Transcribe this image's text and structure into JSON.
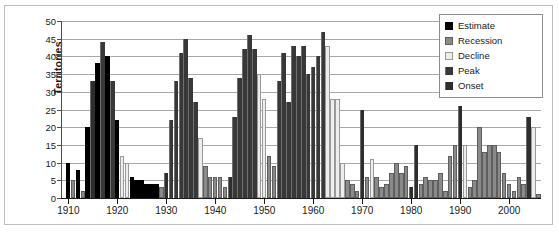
{
  "chart_data": {
    "type": "bar",
    "title": "",
    "xlabel": "",
    "ylabel": "Territories",
    "ylim": [
      0,
      50
    ],
    "ytick_step": 5,
    "yticks": [
      0,
      5,
      10,
      15,
      20,
      25,
      30,
      35,
      40,
      45,
      50
    ],
    "grid": true,
    "legend_position": "top-right",
    "xlim": [
      1909,
      2007
    ],
    "xtick_labels": [
      "1910",
      "1920",
      "1930",
      "1940",
      "1950",
      "1960",
      "1970",
      "1980",
      "1990",
      "2000"
    ],
    "xticks": [
      1910,
      1920,
      1930,
      1940,
      1950,
      1960,
      1970,
      1980,
      1990,
      2000
    ],
    "legend": [
      {
        "label": "Estimate",
        "color": "#000000"
      },
      {
        "label": "Recession",
        "color": "#8a8a8a"
      },
      {
        "label": "Decline",
        "color": "#ededed"
      },
      {
        "label": "Peak",
        "color": "#383838"
      },
      {
        "label": "Onset",
        "color": "#2e2e2e"
      }
    ],
    "series_names": [
      "Estimate",
      "Recession",
      "Decline",
      "Peak",
      "Onset"
    ],
    "points": [
      {
        "year": 1910,
        "value": 10,
        "category": "Estimate"
      },
      {
        "year": 1911,
        "value": 5,
        "category": "Recession"
      },
      {
        "year": 1912,
        "value": 8,
        "category": "Estimate"
      },
      {
        "year": 1913,
        "value": 2,
        "category": "Recession"
      },
      {
        "year": 1914,
        "value": 20,
        "category": "Estimate"
      },
      {
        "year": 1915,
        "value": 33,
        "category": "Onset"
      },
      {
        "year": 1916,
        "value": 38,
        "category": "Estimate"
      },
      {
        "year": 1917,
        "value": 44,
        "category": "Peak"
      },
      {
        "year": 1918,
        "value": 40,
        "category": "Estimate"
      },
      {
        "year": 1919,
        "value": 33,
        "category": "Peak"
      },
      {
        "year": 1920,
        "value": 22,
        "category": "Estimate"
      },
      {
        "year": 1921,
        "value": 12,
        "category": "Decline"
      },
      {
        "year": 1922,
        "value": 10,
        "category": "Decline"
      },
      {
        "year": 1923,
        "value": 6,
        "category": "Estimate"
      },
      {
        "year": 1924,
        "value": 5,
        "category": "Estimate"
      },
      {
        "year": 1925,
        "value": 5,
        "category": "Estimate"
      },
      {
        "year": 1926,
        "value": 4,
        "category": "Estimate"
      },
      {
        "year": 1927,
        "value": 4,
        "category": "Estimate"
      },
      {
        "year": 1928,
        "value": 4,
        "category": "Estimate"
      },
      {
        "year": 1929,
        "value": 3,
        "category": "Recession"
      },
      {
        "year": 1930,
        "value": 7,
        "category": "Onset"
      },
      {
        "year": 1931,
        "value": 22,
        "category": "Peak"
      },
      {
        "year": 1932,
        "value": 33,
        "category": "Peak"
      },
      {
        "year": 1933,
        "value": 41,
        "category": "Peak"
      },
      {
        "year": 1934,
        "value": 45,
        "category": "Peak"
      },
      {
        "year": 1935,
        "value": 34,
        "category": "Peak"
      },
      {
        "year": 1936,
        "value": 27,
        "category": "Peak"
      },
      {
        "year": 1937,
        "value": 17,
        "category": "Decline"
      },
      {
        "year": 1938,
        "value": 9,
        "category": "Recession"
      },
      {
        "year": 1939,
        "value": 6,
        "category": "Recession"
      },
      {
        "year": 1940,
        "value": 6,
        "category": "Recession"
      },
      {
        "year": 1941,
        "value": 6,
        "category": "Recession"
      },
      {
        "year": 1942,
        "value": 3,
        "category": "Recession"
      },
      {
        "year": 1943,
        "value": 6,
        "category": "Onset"
      },
      {
        "year": 1944,
        "value": 23,
        "category": "Peak"
      },
      {
        "year": 1945,
        "value": 34,
        "category": "Peak"
      },
      {
        "year": 1946,
        "value": 42,
        "category": "Peak"
      },
      {
        "year": 1947,
        "value": 46,
        "category": "Peak"
      },
      {
        "year": 1948,
        "value": 42,
        "category": "Peak"
      },
      {
        "year": 1949,
        "value": 35,
        "category": "Decline"
      },
      {
        "year": 1950,
        "value": 28,
        "category": "Decline"
      },
      {
        "year": 1951,
        "value": 12,
        "category": "Recession"
      },
      {
        "year": 1952,
        "value": 9,
        "category": "Recession"
      },
      {
        "year": 1953,
        "value": 33,
        "category": "Peak"
      },
      {
        "year": 1954,
        "value": 41,
        "category": "Peak"
      },
      {
        "year": 1955,
        "value": 27,
        "category": "Peak"
      },
      {
        "year": 1956,
        "value": 43,
        "category": "Peak"
      },
      {
        "year": 1957,
        "value": 40,
        "category": "Peak"
      },
      {
        "year": 1958,
        "value": 43,
        "category": "Peak"
      },
      {
        "year": 1959,
        "value": 35,
        "category": "Peak"
      },
      {
        "year": 1960,
        "value": 37,
        "category": "Peak"
      },
      {
        "year": 1961,
        "value": 40,
        "category": "Peak"
      },
      {
        "year": 1962,
        "value": 47,
        "category": "Peak"
      },
      {
        "year": 1963,
        "value": 43,
        "category": "Decline"
      },
      {
        "year": 1964,
        "value": 28,
        "category": "Decline"
      },
      {
        "year": 1965,
        "value": 28,
        "category": "Decline"
      },
      {
        "year": 1966,
        "value": 10,
        "category": "Decline"
      },
      {
        "year": 1967,
        "value": 5,
        "category": "Recession"
      },
      {
        "year": 1968,
        "value": 4,
        "category": "Recession"
      },
      {
        "year": 1969,
        "value": 2,
        "category": "Recession"
      },
      {
        "year": 1970,
        "value": 25,
        "category": "Onset"
      },
      {
        "year": 1971,
        "value": 6,
        "category": "Recession"
      },
      {
        "year": 1972,
        "value": 11,
        "category": "Decline"
      },
      {
        "year": 1973,
        "value": 6,
        "category": "Recession"
      },
      {
        "year": 1974,
        "value": 3,
        "category": "Recession"
      },
      {
        "year": 1975,
        "value": 4,
        "category": "Recession"
      },
      {
        "year": 1976,
        "value": 7,
        "category": "Recession"
      },
      {
        "year": 1977,
        "value": 10,
        "category": "Recession"
      },
      {
        "year": 1978,
        "value": 7,
        "category": "Recession"
      },
      {
        "year": 1979,
        "value": 9,
        "category": "Recession"
      },
      {
        "year": 1980,
        "value": 3,
        "category": "Onset"
      },
      {
        "year": 1981,
        "value": 15,
        "category": "Onset"
      },
      {
        "year": 1982,
        "value": 4,
        "category": "Recession"
      },
      {
        "year": 1983,
        "value": 6,
        "category": "Recession"
      },
      {
        "year": 1984,
        "value": 5,
        "category": "Recession"
      },
      {
        "year": 1985,
        "value": 5,
        "category": "Recession"
      },
      {
        "year": 1986,
        "value": 7,
        "category": "Recession"
      },
      {
        "year": 1987,
        "value": 2,
        "category": "Recession"
      },
      {
        "year": 1988,
        "value": 12,
        "category": "Recession"
      },
      {
        "year": 1989,
        "value": 15,
        "category": "Recession"
      },
      {
        "year": 1990,
        "value": 26,
        "category": "Onset"
      },
      {
        "year": 1991,
        "value": 15,
        "category": "Decline"
      },
      {
        "year": 1992,
        "value": 3,
        "category": "Recession"
      },
      {
        "year": 1993,
        "value": 5,
        "category": "Recession"
      },
      {
        "year": 1994,
        "value": 20,
        "category": "Recession"
      },
      {
        "year": 1995,
        "value": 13,
        "category": "Recession"
      },
      {
        "year": 1996,
        "value": 15,
        "category": "Recession"
      },
      {
        "year": 1997,
        "value": 15,
        "category": "Recession"
      },
      {
        "year": 1998,
        "value": 13,
        "category": "Recession"
      },
      {
        "year": 1999,
        "value": 7,
        "category": "Recession"
      },
      {
        "year": 2000,
        "value": 4,
        "category": "Recession"
      },
      {
        "year": 2001,
        "value": 2,
        "category": "Recession"
      },
      {
        "year": 2002,
        "value": 6,
        "category": "Recession"
      },
      {
        "year": 2003,
        "value": 4,
        "category": "Recession"
      },
      {
        "year": 2004,
        "value": 23,
        "category": "Onset"
      },
      {
        "year": 2005,
        "value": 20,
        "category": "Decline"
      },
      {
        "year": 2006,
        "value": 1,
        "category": "Recession"
      }
    ]
  }
}
